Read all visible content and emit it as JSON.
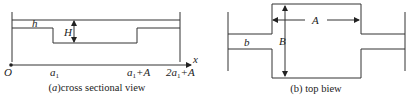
{
  "figure_a": {
    "caption_prefix": "(",
    "caption_italic": "a",
    "caption_suffix": ")cross sectional view",
    "labels": {
      "h": "h",
      "H": "H",
      "x_axis": "x"
    },
    "ticks": [
      {
        "main": "O",
        "sub": "",
        "tail": ""
      },
      {
        "main": "a",
        "sub": "1",
        "tail": ""
      },
      {
        "main": "a",
        "sub": "1",
        "tail": "+A"
      },
      {
        "main": "2a",
        "sub": "1",
        "tail": "+A"
      }
    ]
  },
  "figure_b": {
    "caption": "(b) top biew",
    "labels": {
      "b": "b",
      "B": "B",
      "A": "A"
    }
  },
  "colors": {
    "line": "#333333",
    "text": "#222222"
  }
}
